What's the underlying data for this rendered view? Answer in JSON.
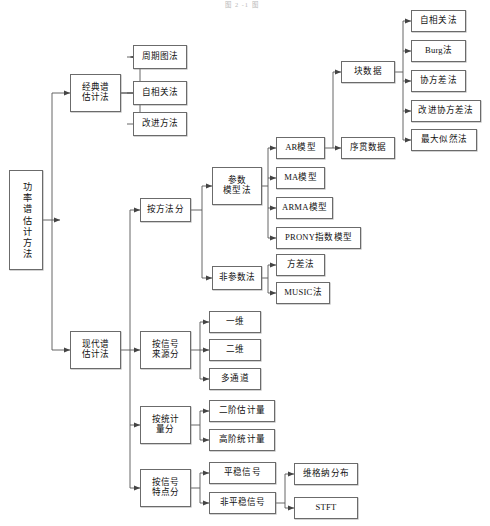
{
  "figure": {
    "caption": "图 2 -1 图",
    "type": "tree-diagram",
    "orientation": "left-to-right",
    "line_color": "#555555",
    "box_border_color": "#6b6b6b",
    "background": "#ffffff"
  },
  "nodes": {
    "root": "功率谱估计方法",
    "classic": "经典谱\n估计法",
    "classic_children": [
      "周期图法",
      "自相关法",
      "改进方法"
    ],
    "modern": "现代谱\n估计法",
    "by_method": "按方法分",
    "parametric": "参数\n模型法",
    "parametric_children": [
      "AR模型",
      "MA模型",
      "ARMA模型",
      "PRONY指数模型"
    ],
    "nonparametric": "非参数法",
    "nonparametric_children": [
      "方差法",
      "MUSIC法"
    ],
    "ar_children": [
      "块数据",
      "序贯数据"
    ],
    "block_children": [
      "自相关法",
      "Burg法",
      "协方差法",
      "改进协方差法",
      "最大似然法"
    ],
    "by_source": "按信号\n来源分",
    "by_source_children": [
      "一维",
      "二维",
      "多通道"
    ],
    "by_statistic": "按统计\n量分",
    "by_statistic_children": [
      "二阶估计量",
      "高阶统计量"
    ],
    "by_feature": "按信号\n特点分",
    "by_feature_children": [
      "平稳信号",
      "非平稳信号"
    ],
    "nonstationary_children": [
      "维格纳分布",
      "STFT"
    ]
  }
}
